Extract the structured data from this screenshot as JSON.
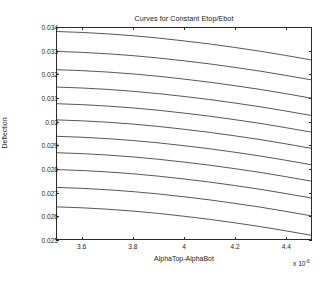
{
  "chart_data": {
    "type": "line",
    "title": "Curves for Constant Etop/Ebot",
    "xlabel": "AlphaTop-AlphaBot",
    "ylabel": "Deflection",
    "x_multiplier_base": "x 10",
    "x_multiplier_exponent": "-6",
    "xlim": [
      3.5,
      4.5
    ],
    "ylim": [
      0.025,
      0.034
    ],
    "xticks": [
      "3.6",
      "3.8",
      "4",
      "4.2",
      "4.4"
    ],
    "xtick_values": [
      3.6,
      3.8,
      4.0,
      4.2,
      4.4
    ],
    "yticks": [
      "0.025",
      "0.026",
      "0.027",
      "0.028",
      "0.029",
      "0.03",
      "0.031",
      "0.032",
      "0.033",
      "0.034"
    ],
    "ytick_values": [
      0.025,
      0.026,
      0.027,
      0.028,
      0.029,
      0.03,
      0.031,
      0.032,
      0.033,
      0.034
    ],
    "grid": false,
    "legend": "none",
    "line_color": "#2b2b2b",
    "x": [
      3.5,
      3.6,
      3.7,
      3.8,
      3.9,
      4.0,
      4.1,
      4.2,
      4.3,
      4.4,
      4.5
    ],
    "series": [
      {
        "name": "curve-1",
        "values": [
          0.03385,
          0.03381,
          0.03375,
          0.03367,
          0.03357,
          0.03345,
          0.03332,
          0.03317,
          0.03301,
          0.03283,
          0.03264
        ]
      },
      {
        "name": "curve-2",
        "values": [
          0.033,
          0.03296,
          0.0329,
          0.03282,
          0.03272,
          0.0326,
          0.03247,
          0.03232,
          0.03216,
          0.03198,
          0.03179
        ]
      },
      {
        "name": "curve-3",
        "values": [
          0.03222,
          0.03218,
          0.03212,
          0.03204,
          0.03194,
          0.03182,
          0.03169,
          0.03154,
          0.03138,
          0.0312,
          0.03101
        ]
      },
      {
        "name": "curve-4",
        "values": [
          0.03148,
          0.03144,
          0.03138,
          0.0313,
          0.0312,
          0.03108,
          0.03095,
          0.0308,
          0.03064,
          0.03046,
          0.03027
        ]
      },
      {
        "name": "curve-5",
        "values": [
          0.03077,
          0.03073,
          0.03067,
          0.03059,
          0.03049,
          0.03037,
          0.03024,
          0.03009,
          0.02993,
          0.02975,
          0.02956
        ]
      },
      {
        "name": "curve-6",
        "values": [
          0.03008,
          0.03004,
          0.02998,
          0.0299,
          0.0298,
          0.02968,
          0.02955,
          0.0294,
          0.02924,
          0.02906,
          0.02887
        ]
      },
      {
        "name": "curve-7",
        "values": [
          0.02938,
          0.02934,
          0.02928,
          0.0292,
          0.0291,
          0.02898,
          0.02885,
          0.0287,
          0.02854,
          0.02836,
          0.02817
        ]
      },
      {
        "name": "curve-8",
        "values": [
          0.02868,
          0.02864,
          0.02858,
          0.0285,
          0.0284,
          0.02828,
          0.02815,
          0.028,
          0.02784,
          0.02766,
          0.02747
        ]
      },
      {
        "name": "curve-9",
        "values": [
          0.02796,
          0.02792,
          0.02786,
          0.02778,
          0.02768,
          0.02756,
          0.02743,
          0.02728,
          0.02712,
          0.02694,
          0.02675
        ]
      },
      {
        "name": "curve-10",
        "values": [
          0.0272,
          0.02716,
          0.0271,
          0.02702,
          0.02692,
          0.0268,
          0.02667,
          0.02652,
          0.02636,
          0.02618,
          0.02599
        ]
      },
      {
        "name": "curve-11",
        "values": [
          0.02637,
          0.02633,
          0.02627,
          0.02619,
          0.02609,
          0.02597,
          0.02584,
          0.02569,
          0.02553,
          0.02535,
          0.02516
        ]
      }
    ]
  }
}
